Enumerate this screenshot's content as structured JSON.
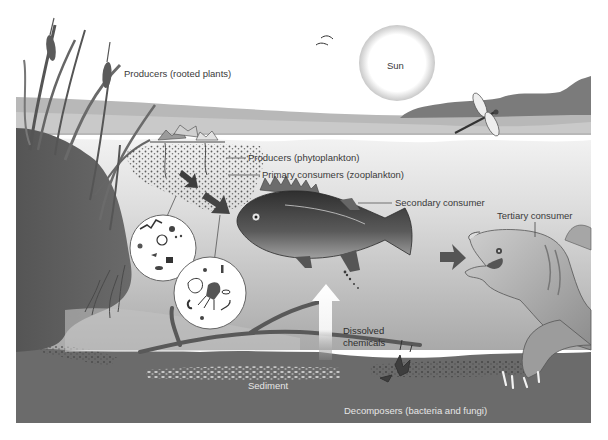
{
  "diagram": {
    "labels": {
      "sun": "Sun",
      "producers_rooted": "Producers (rooted plants)",
      "producers_phyto": "Producers (phytoplankton)",
      "primary_consumers": "Primary consumers (zooplankton)",
      "secondary_consumer": "Secondary consumer",
      "tertiary_consumer": "Tertiary consumer",
      "dissolved_chemicals": "Dissolved\nchemicals",
      "dissolved_line1": "Dissolved",
      "dissolved_line2": "chemicals",
      "sediment": "Sediment",
      "decomposers": "Decomposers (bacteria and fungi)"
    },
    "flow": [
      "Producers (phytoplankton)",
      "Primary consumers (zooplankton)",
      "Secondary consumer",
      "Tertiary consumer"
    ],
    "organisms": [
      "cattails",
      "water lilies",
      "phytoplankton",
      "zooplankton",
      "perch fish",
      "snapping turtle",
      "dragonfly",
      "birds",
      "decomposers"
    ],
    "colors": {
      "sky": "#ffffff",
      "distant_water": "#b5b5b5",
      "hills": "#7a7a7a",
      "water_top": "#e8e8e8",
      "water_deep": "#b0b0b0",
      "bank": "#5e5e5e",
      "sediment": "#6a6a6a",
      "arrow": "#555555"
    }
  }
}
